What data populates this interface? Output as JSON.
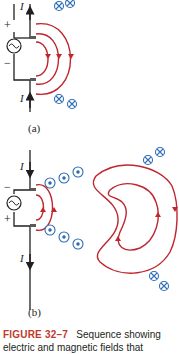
{
  "figure": {
    "number_label": "FIGURE 32–7",
    "caption_text": "Sequence showing electric and magnetic fields that",
    "colors": {
      "field_line": "#c0262d",
      "b_symbol": "#2e6db4",
      "wire": "#231f20",
      "plate": "#5a5a5a",
      "caption_label": "#c0392b"
    }
  },
  "panel_a": {
    "label": "(a)",
    "current_symbol_top": "I",
    "current_symbol_bottom": "I",
    "source_plus": "+",
    "source_minus": "−",
    "source_icon": "ac-source-icon",
    "b_field_top": [
      "cross",
      "cross"
    ],
    "b_field_bottom": [
      "cross",
      "cross"
    ]
  },
  "panel_b": {
    "label": "(b)",
    "current_symbol_top": "I",
    "current_symbol_bottom": "I",
    "source_plus": "+",
    "source_minus": "−",
    "source_icon": "ac-source-icon",
    "b_field_inner_top": [
      "dot",
      "dot",
      "dot"
    ],
    "b_field_inner_bottom": [
      "dot",
      "dot",
      "dot"
    ],
    "b_field_outer_top": [
      "cross",
      "cross"
    ],
    "b_field_outer_bottom": [
      "cross",
      "cross"
    ]
  }
}
